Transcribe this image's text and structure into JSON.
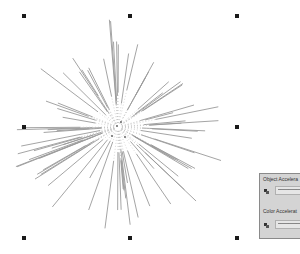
{
  "canvas": {
    "object": "blend-starburst",
    "stroke_color": "#9a9a9a",
    "dot_color": "#c8c8c8",
    "center": [
      118,
      127
    ],
    "selection_handles": [
      [
        24,
        16
      ],
      [
        130,
        16
      ],
      [
        237,
        16
      ],
      [
        24,
        127
      ],
      [
        237,
        127
      ],
      [
        24,
        238
      ],
      [
        130,
        238
      ],
      [
        237,
        238
      ]
    ]
  },
  "panel": {
    "object_acceleration_label": "Object Accelera",
    "color_acceleration_label": "Color Accelerat",
    "ticks": "' ' '",
    "bg_color": "#d4d4d4"
  }
}
